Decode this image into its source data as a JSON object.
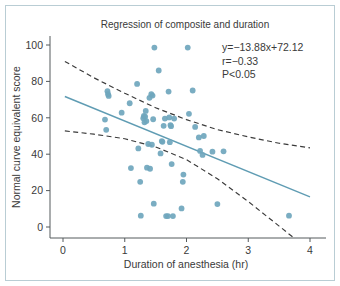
{
  "figure": {
    "title": "Regression of composite and duration",
    "frame_color": "#b9cdd4",
    "background": "#ffffff"
  },
  "annotations": {
    "equation": "y=−13.88x+72.12",
    "correlation": "r=−0.33",
    "pvalue": "P<0.05"
  },
  "chart_data": {
    "type": "scatter",
    "title": "Regression of composite and duration",
    "xlabel": "Duration of anesthesia  (hr)",
    "ylabel": "Normal curve equivalent score",
    "xlim": [
      0,
      4
    ],
    "ylim": [
      -10,
      105
    ],
    "xticks": [
      0,
      1,
      2,
      3,
      4
    ],
    "xticklabels": [
      "0",
      "1",
      "2",
      "3",
      "4"
    ],
    "yticks": [
      0,
      20,
      40,
      60,
      80,
      100
    ],
    "yticklabels": [
      "0",
      "20",
      "40",
      "60",
      "80",
      "100"
    ],
    "grid": false,
    "legend": null,
    "point_color": "#6fa6bd",
    "regression_color": "#5f9cb3",
    "ci_color": "#3a3a3a",
    "regression": {
      "label": "fit line",
      "slope": -13.88,
      "intercept": 72.12,
      "x_start": 0.03,
      "x_end": 4.0,
      "y_start": 71.7,
      "y_end": 16.6
    },
    "confidence_upper": {
      "label": "upper confidence band",
      "x": [
        0.03,
        0.5,
        1.0,
        1.5,
        2.0,
        2.5,
        3.0,
        3.5,
        4.0
      ],
      "y": [
        91.0,
        82.0,
        73.5,
        65.5,
        59.0,
        53.5,
        49.5,
        46.0,
        43.5
      ]
    },
    "confidence_lower": {
      "label": "lower confidence band",
      "x": [
        0.03,
        0.5,
        1.0,
        1.5,
        2.0,
        2.5,
        3.0,
        3.5,
        3.72
      ],
      "y": [
        52.8,
        51.0,
        48.5,
        44.0,
        37.0,
        26.5,
        14.0,
        0.5,
        -5.5
      ]
    },
    "points": [
      {
        "x": 0.68,
        "y": 59.0
      },
      {
        "x": 0.7,
        "y": 53.4
      },
      {
        "x": 0.72,
        "y": 74.6
      },
      {
        "x": 0.73,
        "y": 73.0
      },
      {
        "x": 0.74,
        "y": 72.0
      },
      {
        "x": 0.95,
        "y": 62.8
      },
      {
        "x": 1.08,
        "y": 68.0
      },
      {
        "x": 1.1,
        "y": 32.4
      },
      {
        "x": 1.2,
        "y": 78.6
      },
      {
        "x": 1.22,
        "y": 43.2
      },
      {
        "x": 1.25,
        "y": 24.8
      },
      {
        "x": 1.26,
        "y": 6.2
      },
      {
        "x": 1.3,
        "y": 59.8
      },
      {
        "x": 1.31,
        "y": 61.0
      },
      {
        "x": 1.32,
        "y": 57.5
      },
      {
        "x": 1.33,
        "y": 60.6
      },
      {
        "x": 1.34,
        "y": 63.8
      },
      {
        "x": 1.35,
        "y": 58.2
      },
      {
        "x": 1.36,
        "y": 32.6
      },
      {
        "x": 1.38,
        "y": 45.6
      },
      {
        "x": 1.4,
        "y": 71.0
      },
      {
        "x": 1.41,
        "y": 32.0
      },
      {
        "x": 1.43,
        "y": 73.0
      },
      {
        "x": 1.44,
        "y": 45.2
      },
      {
        "x": 1.45,
        "y": 72.2
      },
      {
        "x": 1.46,
        "y": 59.2
      },
      {
        "x": 1.47,
        "y": 12.8
      },
      {
        "x": 1.48,
        "y": 98.6
      },
      {
        "x": 1.55,
        "y": 86.0
      },
      {
        "x": 1.58,
        "y": 40.4
      },
      {
        "x": 1.6,
        "y": 47.2
      },
      {
        "x": 1.61,
        "y": 46.8
      },
      {
        "x": 1.63,
        "y": 55.6
      },
      {
        "x": 1.65,
        "y": 59.6
      },
      {
        "x": 1.67,
        "y": 6.0
      },
      {
        "x": 1.7,
        "y": 6.0
      },
      {
        "x": 1.71,
        "y": 74.4
      },
      {
        "x": 1.72,
        "y": 60.2
      },
      {
        "x": 1.73,
        "y": 46.6
      },
      {
        "x": 1.74,
        "y": 56.0
      },
      {
        "x": 1.75,
        "y": 55.4
      },
      {
        "x": 1.76,
        "y": 34.6
      },
      {
        "x": 1.78,
        "y": 6.0
      },
      {
        "x": 1.8,
        "y": 59.6
      },
      {
        "x": 1.92,
        "y": 10.2
      },
      {
        "x": 1.94,
        "y": 24.8
      },
      {
        "x": 1.95,
        "y": 28.8
      },
      {
        "x": 2.02,
        "y": 98.6
      },
      {
        "x": 2.04,
        "y": 62.2
      },
      {
        "x": 2.1,
        "y": 75.0
      },
      {
        "x": 2.14,
        "y": 55.0
      },
      {
        "x": 2.2,
        "y": 49.2
      },
      {
        "x": 2.22,
        "y": 41.8
      },
      {
        "x": 2.26,
        "y": 39.6
      },
      {
        "x": 2.28,
        "y": 50.0
      },
      {
        "x": 2.42,
        "y": 41.4
      },
      {
        "x": 2.5,
        "y": 12.6
      },
      {
        "x": 2.6,
        "y": 41.6
      },
      {
        "x": 3.66,
        "y": 6.2
      }
    ]
  }
}
